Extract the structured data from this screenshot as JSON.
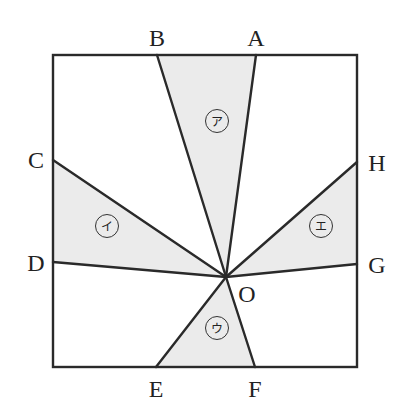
{
  "figure": {
    "type": "geometry-square-with-rays",
    "fill_color": "#ebebeb",
    "stroke_color": "#2a2a2a",
    "square": {
      "x1": 53,
      "y1": 55,
      "x2": 357,
      "y2": 367
    },
    "center": {
      "name": "O",
      "x": 226,
      "y": 277,
      "label_x": 247,
      "label_y": 302
    },
    "points": [
      {
        "name": "A",
        "x": 256,
        "y": 55,
        "label_x": 256,
        "label_y": 46
      },
      {
        "name": "B",
        "x": 157,
        "y": 55,
        "label_x": 157,
        "label_y": 46
      },
      {
        "name": "C",
        "x": 53,
        "y": 160,
        "label_x": 36,
        "label_y": 168
      },
      {
        "name": "D",
        "x": 53,
        "y": 262,
        "label_x": 36,
        "label_y": 271
      },
      {
        "name": "E",
        "x": 156,
        "y": 367,
        "label_x": 156,
        "label_y": 397
      },
      {
        "name": "F",
        "x": 255,
        "y": 367,
        "label_x": 255,
        "label_y": 397
      },
      {
        "name": "G",
        "x": 357,
        "y": 264,
        "label_x": 377,
        "label_y": 273
      },
      {
        "name": "H",
        "x": 357,
        "y": 162,
        "label_x": 377,
        "label_y": 171
      }
    ],
    "regions": [
      {
        "label": "ア",
        "vertices": [
          "O",
          "A",
          "B"
        ],
        "label_x": 217,
        "label_y": 121
      },
      {
        "label": "イ",
        "vertices": [
          "O",
          "C",
          "D"
        ],
        "label_x": 107,
        "label_y": 226
      },
      {
        "label": "ウ",
        "vertices": [
          "O",
          "E",
          "F"
        ],
        "label_x": 217,
        "label_y": 328
      },
      {
        "label": "エ",
        "vertices": [
          "O",
          "G",
          "H"
        ],
        "label_x": 321,
        "label_y": 226
      }
    ]
  }
}
